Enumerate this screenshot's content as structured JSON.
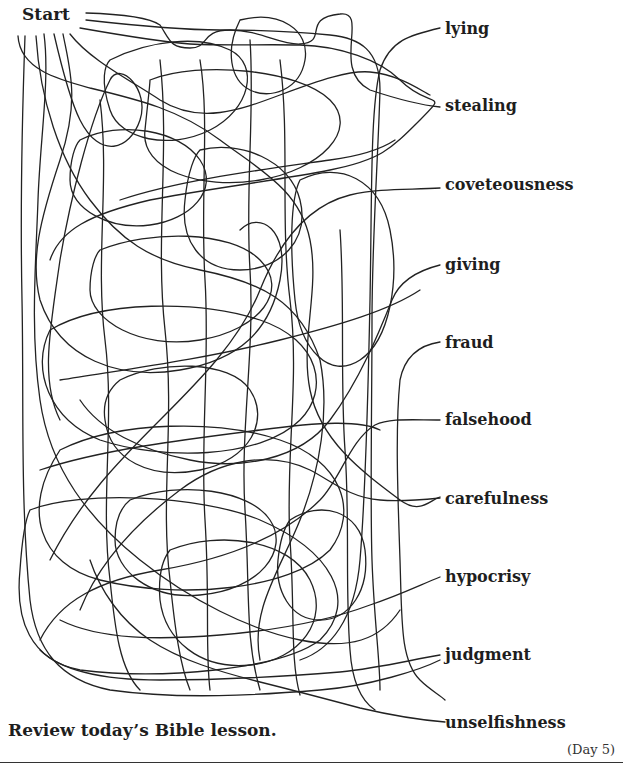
{
  "worksheet": {
    "start_label": "Start",
    "endpoints": [
      {
        "label": "lying"
      },
      {
        "label": "stealing"
      },
      {
        "label": "coveteousness"
      },
      {
        "label": "giving"
      },
      {
        "label": "fraud"
      },
      {
        "label": "falsehood"
      },
      {
        "label": "carefulness"
      },
      {
        "label": "hypocrisy"
      },
      {
        "label": "judgment"
      },
      {
        "label": "unselfishness"
      }
    ],
    "instruction": "Review today’s Bible lesson.",
    "day": "(Day 5)"
  }
}
